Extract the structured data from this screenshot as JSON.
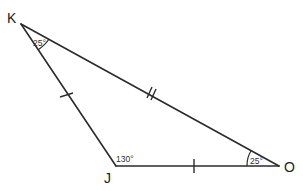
{
  "diagram": {
    "type": "triangle",
    "background": "#ffffff",
    "line_color": "#2b2b2b",
    "vertices": {
      "K": {
        "label": "K",
        "x": 21,
        "y": 24
      },
      "J": {
        "label": "J",
        "x": 116,
        "y": 166
      },
      "O": {
        "label": "O",
        "x": 279,
        "y": 166
      }
    },
    "angles": {
      "K": {
        "label": "25°"
      },
      "J": {
        "label": "130°"
      },
      "O": {
        "label": "25°"
      }
    },
    "sides": [
      {
        "from": "K",
        "to": "J",
        "tick_marks": 1
      },
      {
        "from": "J",
        "to": "O",
        "tick_marks": 1
      },
      {
        "from": "K",
        "to": "O",
        "tick_marks": 2
      }
    ]
  }
}
